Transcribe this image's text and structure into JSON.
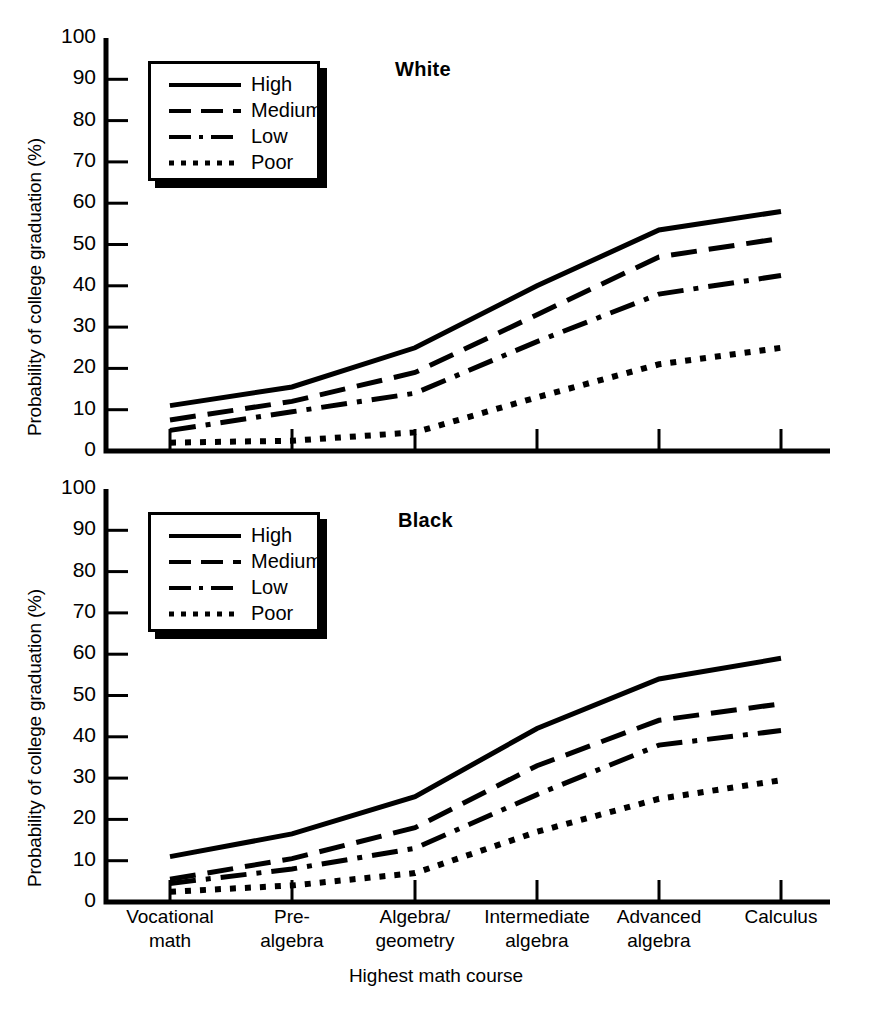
{
  "figure": {
    "ylabel": "Probability of college graduation (%)",
    "xlabel": "Highest math course",
    "yticks": [
      "0",
      "10",
      "20",
      "30",
      "40",
      "50",
      "60",
      "70",
      "80",
      "90",
      "100"
    ],
    "xticklabels": [
      {
        "line1": "Vocational",
        "line2": "math"
      },
      {
        "line1": "Pre-",
        "line2": "algebra"
      },
      {
        "line1": "Algebra/",
        "line2": "geometry"
      },
      {
        "line1": "Intermediate",
        "line2": "algebra"
      },
      {
        "line1": "Advanced",
        "line2": "algebra"
      },
      {
        "line1": "Calculus",
        "line2": ""
      }
    ],
    "legend": [
      {
        "label": "High",
        "style": "solid"
      },
      {
        "label": "Medium",
        "style": "dashed"
      },
      {
        "label": "Low",
        "style": "dashdot"
      },
      {
        "label": "Poor",
        "style": "dotted"
      }
    ],
    "line_color": "#000000",
    "background_color": "#ffffff"
  },
  "chart_data": [
    {
      "type": "line",
      "title": "White",
      "xlabel": "Highest math course",
      "ylabel": "Probability of college graduation (%)",
      "categories": [
        "Vocational math",
        "Pre-algebra",
        "Algebra/geometry",
        "Intermediate algebra",
        "Advanced algebra",
        "Calculus"
      ],
      "ylim": [
        0,
        100
      ],
      "yticks": [
        0,
        10,
        20,
        30,
        40,
        50,
        60,
        70,
        80,
        90,
        100
      ],
      "grid": false,
      "legend_position": "upper-left",
      "series": [
        {
          "name": "High",
          "style": "solid",
          "values": [
            11,
            15.5,
            25,
            40,
            53.5,
            58
          ]
        },
        {
          "name": "Medium",
          "style": "dashed",
          "values": [
            7.5,
            12,
            19,
            33,
            47,
            51.5
          ]
        },
        {
          "name": "Low",
          "style": "dashdot",
          "values": [
            5,
            9.5,
            14,
            26.5,
            38,
            42.5
          ]
        },
        {
          "name": "Poor",
          "style": "dotted",
          "values": [
            2,
            2.5,
            4.5,
            13,
            21,
            25
          ]
        }
      ]
    },
    {
      "type": "line",
      "title": "Black",
      "xlabel": "Highest math course",
      "ylabel": "Probability of college graduation (%)",
      "categories": [
        "Vocational math",
        "Pre-algebra",
        "Algebra/geometry",
        "Intermediate algebra",
        "Advanced algebra",
        "Calculus"
      ],
      "ylim": [
        0,
        100
      ],
      "yticks": [
        0,
        10,
        20,
        30,
        40,
        50,
        60,
        70,
        80,
        90,
        100
      ],
      "grid": false,
      "legend_position": "upper-left",
      "series": [
        {
          "name": "High",
          "style": "solid",
          "values": [
            11,
            16.5,
            25.5,
            42,
            54,
            59
          ]
        },
        {
          "name": "Medium",
          "style": "dashed",
          "values": [
            5.5,
            10.5,
            18,
            33,
            44,
            48
          ]
        },
        {
          "name": "Low",
          "style": "dashdot",
          "values": [
            4.5,
            8,
            13,
            26,
            38,
            41.5
          ]
        },
        {
          "name": "Poor",
          "style": "dotted",
          "values": [
            2.5,
            4,
            7,
            17,
            25,
            29.5
          ]
        }
      ]
    }
  ]
}
